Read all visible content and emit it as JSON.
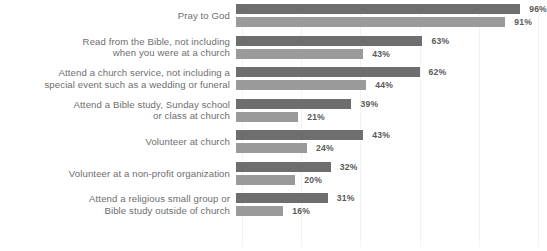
{
  "chart_data": {
    "type": "bar",
    "title": "",
    "xlabel": "",
    "ylabel": "",
    "xlim": [
      0,
      100
    ],
    "grid": true,
    "orientation": "horizontal",
    "legend_position": "none",
    "value_suffix": "%",
    "colors": {
      "series_1": "#6e6e6e",
      "series_2": "#9a9a9a",
      "label_text": "#6e6e6e",
      "value_text": "#5a5a5a",
      "gridline": "#f2f2f2",
      "background": "#ffffff"
    },
    "categories": [
      "Pray to God",
      "Read from the Bible, not including\nwhen you were at a church",
      "Attend a church service, not including a\nspecial event such as a wedding or funeral",
      "Attend a Bible study, Sunday school\nor class at church",
      "Volunteer at church",
      "Volunteer at a non-profit organization",
      "Attend a religious small group or\nBible study outside of church"
    ],
    "series": [
      {
        "name": "series_1",
        "values": [
          96,
          63,
          62,
          39,
          43,
          32,
          31
        ],
        "labels": [
          "96%",
          "63%",
          "62%",
          "39%",
          "43%",
          "32%",
          "31%"
        ]
      },
      {
        "name": "series_2",
        "values": [
          91,
          43,
          44,
          21,
          24,
          20,
          16
        ],
        "labels": [
          "91%",
          "43%",
          "44%",
          "21%",
          "24%",
          "20%",
          "16%"
        ]
      }
    ],
    "gridline_positions": [
      0,
      20,
      40,
      60,
      80,
      100
    ]
  }
}
